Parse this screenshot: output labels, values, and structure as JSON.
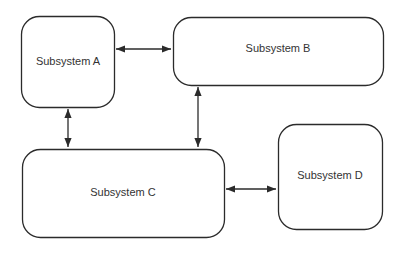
{
  "diagram": {
    "nodes": [
      {
        "id": "A",
        "label": "Subsystem A"
      },
      {
        "id": "B",
        "label": "Subsystem B"
      },
      {
        "id": "C",
        "label": "Subsystem C"
      },
      {
        "id": "D",
        "label": "Subsystem D"
      }
    ],
    "edges": [
      {
        "from": "A",
        "to": "B",
        "direction": "bidirectional"
      },
      {
        "from": "A",
        "to": "C",
        "direction": "bidirectional"
      },
      {
        "from": "B",
        "to": "C",
        "direction": "bidirectional"
      },
      {
        "from": "C",
        "to": "D",
        "direction": "bidirectional"
      }
    ],
    "colors": {
      "stroke": "#2b2b2b",
      "text": "#333333",
      "background": "#ffffff"
    }
  }
}
